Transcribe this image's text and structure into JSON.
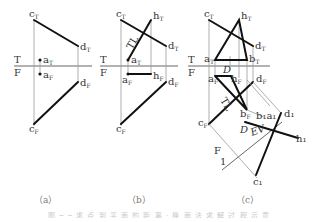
{
  "figure": {
    "panels": [
      {
        "id": "a",
        "caption": "（a）",
        "fold_line": {
          "top": "T",
          "bottom": "F"
        },
        "points": {
          "cT": "c",
          "dT": "d",
          "aT": "a",
          "aF": "a",
          "dF": "d",
          "cF": "c"
        },
        "subscripts": {
          "top": "T",
          "front": "F"
        }
      },
      {
        "id": "b",
        "caption": "（b）",
        "fold_line": {
          "top": "T",
          "bottom": "F"
        },
        "labels": {
          "TL": "TL",
          "hT": "h",
          "hF": "h"
        }
      },
      {
        "id": "c",
        "caption": "（c）",
        "fold_line": {
          "top": "T",
          "bottom": "F"
        },
        "labels": {
          "bT": "b",
          "bF": "b",
          "D1": "D",
          "D2": "D",
          "TL": "TL",
          "EV": "EV",
          "F": "F",
          "one": "1",
          "b1a1": "b₁a₁",
          "d1": "d₁",
          "h1": "h₁",
          "c1": "c₁"
        }
      }
    ],
    "caption_text": "图 ─ ─ 求 点 到 平 面 的 距 离 · 换 面 法 求 解 过 程 示 意"
  }
}
